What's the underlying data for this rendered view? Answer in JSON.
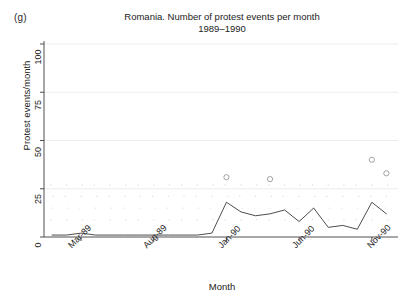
{
  "panel": {
    "label": "(g)"
  },
  "chart_data": {
    "type": "line",
    "title": "Romania. Number of protest events per month",
    "subtitle": "1989–1990",
    "xlabel": "Month",
    "ylabel": "Protest events/month",
    "ylim": [
      0,
      100
    ],
    "yticks": [
      0,
      25,
      50,
      75,
      100
    ],
    "ytick_labels": [
      "0",
      "25",
      "50",
      "75",
      "100"
    ],
    "xtick_labels": [
      "Mar-89",
      "Aug-89",
      "Jan-90",
      "Jun-90",
      "Nov-90"
    ],
    "xtick_indices": [
      2,
      7,
      12,
      17,
      22
    ],
    "grid": true,
    "legend": "none",
    "x": [
      "Jan-89",
      "Feb-89",
      "Mar-89",
      "Apr-89",
      "May-89",
      "Jun-89",
      "Jul-89",
      "Aug-89",
      "Sep-89",
      "Oct-89",
      "Nov-89",
      "Dec-89",
      "Jan-90",
      "Feb-90",
      "Mar-90",
      "Apr-90",
      "May-90",
      "Jun-90",
      "Jul-90",
      "Aug-90",
      "Sep-90",
      "Oct-90",
      "Nov-90",
      "Dec-90"
    ],
    "series": [
      {
        "name": "Protest events per month",
        "values": [
          1,
          1,
          2,
          1,
          1,
          1,
          1,
          1,
          1,
          1,
          1,
          2,
          18,
          13,
          11,
          12,
          14,
          8,
          15,
          5,
          6,
          4,
          18,
          12
        ]
      }
    ],
    "outlier_markers": [
      {
        "x": "Jan-90",
        "y": 31
      },
      {
        "x": "Apr-90",
        "y": 30
      },
      {
        "x": "Nov-90",
        "y": 40
      },
      {
        "x": "Dec-90",
        "y": 33
      }
    ]
  }
}
